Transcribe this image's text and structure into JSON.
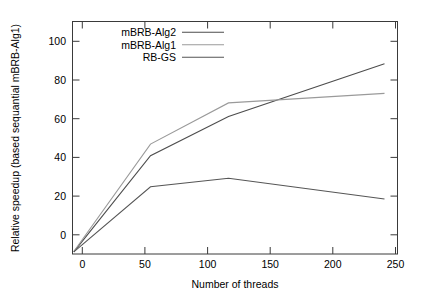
{
  "chart_data": {
    "type": "line",
    "title": "",
    "subtitle": "",
    "xlabel": "Number of threads",
    "ylabel": "Relative speedup (based sequantial mBRB-Alg1)",
    "xlim": [
      0,
      250
    ],
    "ylim": [
      0,
      110
    ],
    "xticks": [
      0,
      50,
      100,
      150,
      200,
      250
    ],
    "yticks": [
      0,
      20,
      40,
      60,
      80,
      100
    ],
    "xtick_labels": [
      "0",
      "50",
      "100",
      "150",
      "200",
      "250"
    ],
    "ytick_labels": [
      "0",
      "20",
      "40",
      "60",
      "80",
      "100"
    ],
    "grid": false,
    "legend_position": "top-left",
    "x": [
      1,
      60,
      120,
      240
    ],
    "series": [
      {
        "name": "mBRB-Alg2",
        "color": "#4d4d4d",
        "values": [
          1.0,
          46.5,
          65.0,
          90.0
        ]
      },
      {
        "name": "mBRB-Alg1",
        "color": "#9a9a9a",
        "values": [
          1.2,
          52.0,
          71.5,
          76.0
        ]
      },
      {
        "name": "RB-GS",
        "color": "#555555",
        "values": [
          1.0,
          31.8,
          35.8,
          26.0
        ]
      }
    ]
  },
  "legend": {
    "entries": [
      {
        "label": "mBRB-Alg2"
      },
      {
        "label": "mBRB-Alg1"
      },
      {
        "label": "RB-GS"
      }
    ]
  },
  "axes": {
    "x_title": "Number of threads",
    "y_title": "Relative speedup (based sequantial mBRB-Alg1)"
  }
}
